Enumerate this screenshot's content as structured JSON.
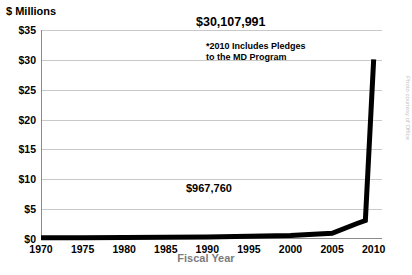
{
  "chart_data": {
    "type": "line",
    "title": "",
    "ylabel": "$ Millions",
    "xlabel": "Fiscal Year",
    "ylim": [
      0,
      35
    ],
    "xlim": [
      1970,
      2011
    ],
    "grid": true,
    "legend": "none",
    "ytick_labels": [
      "$0",
      "$5",
      "$10",
      "$15",
      "$20",
      "$25",
      "$30",
      "$35"
    ],
    "ytick_values": [
      0,
      5,
      10,
      15,
      20,
      25,
      30,
      35
    ],
    "xtick_labels": [
      "1970",
      "1975",
      "1980",
      "1985",
      "1990",
      "1995",
      "2000",
      "2005",
      "2010"
    ],
    "xtick_values": [
      1970,
      1975,
      1980,
      1985,
      1990,
      1995,
      2000,
      2005,
      2010
    ],
    "series": [
      {
        "name": "Fundraising",
        "color": "#000000",
        "x": [
          1970,
          1975,
          1980,
          1985,
          1990,
          1995,
          2000,
          2005,
          2008,
          2009,
          2010
        ],
        "values": [
          0.2,
          0.2,
          0.25,
          0.3,
          0.35,
          0.45,
          0.6,
          0.97,
          2.6,
          3.1,
          30.1
        ]
      }
    ],
    "annotations": [
      {
        "name": "peak-value",
        "text": "$30,107,991",
        "x": 2010,
        "y": 30.1
      },
      {
        "name": "footnote",
        "text": "*2010 Includes Pledges\nto the MD Program",
        "x": 2006,
        "y": 26
      },
      {
        "name": "low-value",
        "text": "$967,760",
        "x": 2005,
        "y": 0.97
      }
    ],
    "side_credit": "Photo courtesy of Office"
  }
}
